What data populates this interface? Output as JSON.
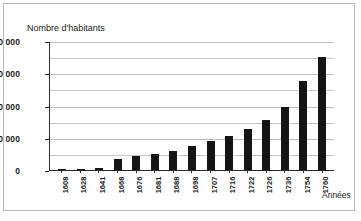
{
  "chart_data": {
    "type": "bar",
    "title": "",
    "ylabel": "Nombre d'habitants",
    "xlabel": "Années",
    "categories": [
      "1608",
      "1628",
      "1641",
      "1668",
      "1676",
      "1681",
      "1688",
      "1698",
      "1707",
      "1716",
      "1722",
      "1726",
      "1736",
      "1754",
      "1760"
    ],
    "values": [
      500,
      700,
      1200,
      7000,
      8500,
      10000,
      11500,
      15000,
      18000,
      21000,
      25500,
      31000,
      39000,
      55000,
      70000
    ],
    "ylim": [
      0,
      80000
    ],
    "ytick_labels": [
      "0",
      "20 000",
      "40 000",
      "60 000",
      "80 000"
    ],
    "ytick_values": [
      0,
      20000,
      40000,
      60000,
      80000
    ],
    "minor_gridlines": [
      10000,
      30000,
      50000,
      70000
    ],
    "grid": true,
    "legend": "none",
    "bar_color": "#141414",
    "axis_color": "#2b2b2b",
    "grid_color": "#c6c6c6",
    "background": "#ffffff"
  }
}
